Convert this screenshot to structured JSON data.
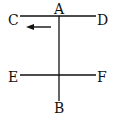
{
  "diagram": {
    "labels": {
      "A": "A",
      "B": "B",
      "C": "C",
      "D": "D",
      "E": "E",
      "F": "F"
    },
    "lines": [
      {
        "name": "CD",
        "from": "C",
        "to": "D",
        "orientation": "horizontal"
      },
      {
        "name": "EF",
        "from": "E",
        "to": "F",
        "orientation": "horizontal"
      },
      {
        "name": "AB",
        "from": "A",
        "to": "B",
        "orientation": "vertical"
      }
    ],
    "arrow": {
      "direction": "left",
      "position": "below line CD, left of AB"
    },
    "colors": {
      "stroke": "#111111",
      "background": "#ffffff"
    }
  }
}
